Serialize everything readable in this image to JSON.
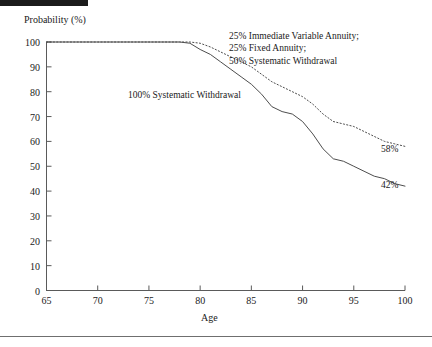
{
  "chart_data": {
    "type": "line",
    "title": "",
    "xlabel": "Age",
    "ylabel": "Probability (%)",
    "xlim": [
      65,
      100
    ],
    "ylim": [
      0,
      100
    ],
    "xticks": [
      65,
      70,
      75,
      80,
      85,
      90,
      95,
      100
    ],
    "yticks": [
      0,
      10,
      20,
      30,
      40,
      50,
      60,
      70,
      80,
      90,
      100
    ],
    "grid": false,
    "legend_position": "inline-annotations",
    "series": [
      {
        "name": "100% Systematic Withdrawal",
        "style": "solid",
        "color": "#4d4d4d",
        "endpoint_label": "42%",
        "x": [
          65,
          70,
          75,
          78,
          79,
          80,
          81,
          82,
          83,
          84,
          85,
          86,
          87,
          88,
          89,
          90,
          91,
          92,
          93,
          94,
          95,
          96,
          97,
          98,
          99,
          100
        ],
        "y": [
          100,
          100,
          100,
          100,
          99.5,
          97,
          95,
          92,
          89,
          86,
          83,
          79,
          74,
          72,
          71,
          68,
          63,
          57,
          53,
          52,
          50,
          48,
          46,
          45,
          43,
          42
        ]
      },
      {
        "name": "25% Immediate Variable Annuity; 25% Fixed Annuity; 50% Systematic Withdrawal",
        "style": "dotted",
        "color": "#4d4d4d",
        "endpoint_label": "58%",
        "x": [
          65,
          70,
          75,
          78,
          79,
          80,
          81,
          82,
          83,
          84,
          85,
          86,
          87,
          88,
          89,
          90,
          91,
          92,
          93,
          94,
          95,
          96,
          97,
          98,
          99,
          100
        ],
        "y": [
          100,
          100,
          100,
          100,
          100,
          99.5,
          98,
          96,
          94,
          92,
          90,
          87,
          84,
          82,
          80,
          78,
          75,
          71,
          68,
          67,
          66,
          64,
          62,
          60,
          59,
          58
        ]
      }
    ],
    "annotations": [
      {
        "id": "annotation-mixed",
        "lines": [
          "25% Immediate Variable Annuity;",
          "25% Fixed  Annuity;",
          "50% Systematic Withdrawal"
        ]
      },
      {
        "id": "annotation-systematic",
        "lines": [
          "100% Systematic Withdrawal"
        ]
      }
    ]
  },
  "axes": {
    "y_title": "Probability (%)",
    "x_title": "Age",
    "y_tick_labels": [
      "100",
      "90",
      "80",
      "70",
      "60",
      "50",
      "40",
      "30",
      "20",
      "10",
      "0"
    ],
    "x_tick_labels": [
      "65",
      "70",
      "75",
      "80",
      "85",
      "90",
      "95",
      "100"
    ]
  },
  "labels": {
    "mixed_line_1": "25% Immediate Variable Annuity;",
    "mixed_line_2": "25% Fixed  Annuity;",
    "mixed_line_3": "50% Systematic Withdrawal",
    "systematic": "100% Systematic Withdrawal",
    "endpoint_dotted": "58%",
    "endpoint_solid": "42%"
  }
}
